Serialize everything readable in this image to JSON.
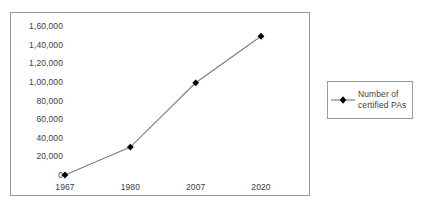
{
  "chart_data": {
    "type": "line",
    "title": "",
    "subtitle": "",
    "xlabel": "",
    "ylabel": "",
    "categories": [
      "1967",
      "1980",
      "2007",
      "2020"
    ],
    "series": [
      {
        "name": "Number of certified PAs",
        "values": [
          0,
          30000,
          99000,
          149000
        ]
      }
    ],
    "ylim": [
      0,
      160000
    ],
    "ytick_values": [
      160000,
      140000,
      120000,
      100000,
      80000,
      60000,
      40000,
      20000,
      0
    ],
    "ytick_labels": [
      "1,60,000",
      "1,40,000",
      "1,20,000",
      "1,00,000",
      "80,000",
      "60,000",
      "40,000",
      "20,000",
      "0"
    ],
    "grid": false,
    "legend_position": "right",
    "line_color": "#808080",
    "marker_color": "#000000",
    "marker_shape": "diamond",
    "border_color": "#9a9a9a",
    "text_color": "#3d3d3d"
  },
  "legend": {
    "entries": [
      {
        "label": "Number of certified PAs"
      }
    ]
  }
}
